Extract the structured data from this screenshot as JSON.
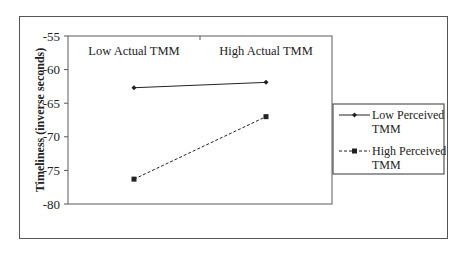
{
  "chart_data": {
    "type": "line",
    "title": "",
    "xlabel": "",
    "ylabel": "Timeliness (inverse seconds)",
    "categories": [
      "Low Actual TMM",
      "High Actual TMM"
    ],
    "series": [
      {
        "name": "Low Perceived TMM",
        "values": [
          -62.7,
          -61.9
        ],
        "line_style": "solid",
        "marker": "diamond",
        "color": "#222222"
      },
      {
        "name": "High Perceived TMM",
        "values": [
          -76.3,
          -67.0
        ],
        "line_style": "dashed",
        "marker": "square",
        "color": "#222222"
      }
    ],
    "ylim": [
      -80,
      -55
    ],
    "yticks": [
      -55,
      -60,
      -65,
      -70,
      -75,
      -80
    ],
    "ytick_labels": [
      "-55",
      "-60",
      "-65",
      "-70",
      "-75",
      "-80"
    ],
    "grid": false,
    "legend_position": "right",
    "category_labels_position": "top-inside"
  },
  "legend": {
    "items": [
      {
        "line1": "Low Perceived",
        "line2": "TMM"
      },
      {
        "line1": "High Perceived",
        "line2": "TMM"
      }
    ]
  }
}
